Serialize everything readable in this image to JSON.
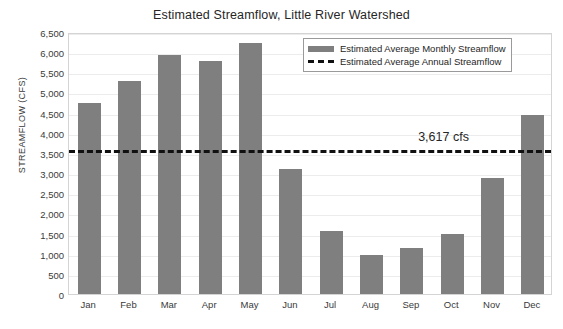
{
  "chart_data": {
    "type": "bar",
    "title": "Estimated Streamflow, Little River Watershed",
    "xlabel": "",
    "ylabel": "STREAMFLOW (CFS)",
    "categories": [
      "Jan",
      "Feb",
      "Mar",
      "Apr",
      "May",
      "Jun",
      "Jul",
      "Aug",
      "Sep",
      "Oct",
      "Nov",
      "Dec"
    ],
    "series": [
      {
        "name": "Estimated Average Monthly Streamflow",
        "type": "bar",
        "color": "#7f7f7f",
        "values": [
          4750,
          5280,
          5940,
          5770,
          6230,
          3110,
          1560,
          960,
          1150,
          1490,
          2880,
          4450
        ]
      },
      {
        "name": "Estimated Average Annual Streamflow",
        "type": "line",
        "style": "dashed",
        "color": "#111111",
        "value": 3617
      }
    ],
    "ylim": [
      0,
      6500
    ],
    "ytick_step": 500,
    "ytick_labels": [
      "0",
      "500",
      "1,000",
      "1,500",
      "2,000",
      "2,500",
      "3,000",
      "3,500",
      "4,000",
      "4,500",
      "5,000",
      "5,500",
      "6,000",
      "6,500"
    ],
    "ytick_values": [
      0,
      500,
      1000,
      1500,
      2000,
      2500,
      3000,
      3500,
      4000,
      4500,
      5000,
      5500,
      6000,
      6500
    ],
    "grid": true,
    "annotations": [
      {
        "text": "3,617 cfs",
        "value": 3617,
        "near_category": "Oct"
      }
    ],
    "legend": {
      "position": "top-right",
      "entries": [
        {
          "label": "Estimated Average Monthly Streamflow",
          "marker": "bar-swatch"
        },
        {
          "label": "Estimated Average Annual Streamflow",
          "marker": "dashed-line-swatch"
        }
      ]
    }
  }
}
